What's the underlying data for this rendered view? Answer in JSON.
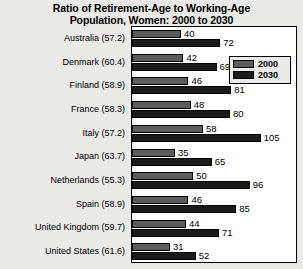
{
  "chart_data": {
    "type": "bar",
    "orientation": "horizontal",
    "title": "Ratio of Retirement-Age to Working-Age Population, Women: 2000 to 2030",
    "title_lines": [
      "Ratio of Retirement-Age to Working-Age",
      "Population, Women: 2000 to 2030"
    ],
    "xlabel": "",
    "ylabel": "",
    "xlim": [
      0,
      133
    ],
    "grid": false,
    "legend_position": "upper-right-inside",
    "categories": [
      "Australia (57.2)",
      "Denmark (60.4)",
      "Finland (58.9)",
      "France (58.3)",
      "Italy (57.2)",
      "Japan (63.7)",
      "Netherlands (55.3)",
      "Spain (58.9)",
      "United Kingdom (59.7)",
      "United States (61.6)"
    ],
    "series": [
      {
        "name": "2000",
        "color": "#5b5b5b",
        "values": [
          40,
          42,
          46,
          48,
          58,
          35,
          50,
          46,
          44,
          31
        ]
      },
      {
        "name": "2030",
        "color": "#1a1a1a",
        "values": [
          72,
          69,
          81,
          80,
          105,
          65,
          96,
          85,
          71,
          52
        ]
      }
    ]
  },
  "legend": {
    "items": [
      {
        "label": "2000",
        "color": "#5b5b5b"
      },
      {
        "label": "2030",
        "color": "#1a1a1a"
      }
    ]
  }
}
